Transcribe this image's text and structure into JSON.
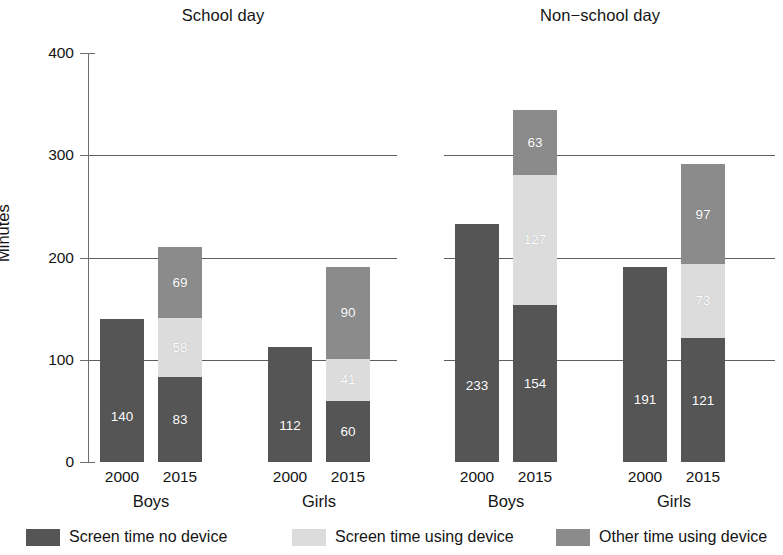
{
  "chart_data": {
    "type": "bar",
    "title": "",
    "subtitle": "",
    "stacked": true,
    "xlabel": "",
    "ylabel": "Minutes",
    "ylim": [
      0,
      400
    ],
    "yticks": [
      0,
      100,
      200,
      300,
      400
    ],
    "grid": "horizontal gridlines at 100, 200, 300",
    "legend_position": "bottom",
    "panels": [
      {
        "title": "School day",
        "groups": [
          {
            "label": "Boys",
            "bars": [
              {
                "x": "2000",
                "total": 140,
                "segments": [
                  {
                    "series": "Screen time no device",
                    "value": 140,
                    "label": "140",
                    "color": "#555555"
                  }
                ]
              },
              {
                "x": "2015",
                "total": 210,
                "segments": [
                  {
                    "series": "Screen time no device",
                    "value": 83,
                    "label": "83",
                    "color": "#555555"
                  },
                  {
                    "series": "Screen time using device",
                    "value": 58,
                    "label": "58",
                    "color": "#dcdcdc"
                  },
                  {
                    "series": "Other time using device",
                    "value": 69,
                    "label": "69",
                    "color": "#8b8b8b"
                  }
                ]
              }
            ]
          },
          {
            "label": "Girls",
            "bars": [
              {
                "x": "2000",
                "total": 112,
                "segments": [
                  {
                    "series": "Screen time no device",
                    "value": 112,
                    "label": "112",
                    "color": "#555555"
                  }
                ]
              },
              {
                "x": "2015",
                "total": 191,
                "segments": [
                  {
                    "series": "Screen time no device",
                    "value": 60,
                    "label": "60",
                    "color": "#555555"
                  },
                  {
                    "series": "Screen time using device",
                    "value": 41,
                    "label": "41",
                    "color": "#dcdcdc"
                  },
                  {
                    "series": "Other time using device",
                    "value": 90,
                    "label": "90",
                    "color": "#8b8b8b"
                  }
                ]
              }
            ]
          }
        ]
      },
      {
        "title": "Non−school day",
        "groups": [
          {
            "label": "Boys",
            "bars": [
              {
                "x": "2000",
                "total": 233,
                "segments": [
                  {
                    "series": "Screen time no device",
                    "value": 233,
                    "label": "233",
                    "color": "#555555"
                  }
                ]
              },
              {
                "x": "2015",
                "total": 344,
                "segments": [
                  {
                    "series": "Screen time no device",
                    "value": 154,
                    "label": "154",
                    "color": "#555555"
                  },
                  {
                    "series": "Screen time using device",
                    "value": 127,
                    "label": "127",
                    "color": "#dcdcdc"
                  },
                  {
                    "series": "Other time using device",
                    "value": 63,
                    "label": "63",
                    "color": "#8b8b8b"
                  }
                ]
              }
            ]
          },
          {
            "label": "Girls",
            "bars": [
              {
                "x": "2000",
                "total": 191,
                "segments": [
                  {
                    "series": "Screen time no device",
                    "value": 191,
                    "label": "191",
                    "color": "#555555"
                  }
                ]
              },
              {
                "x": "2015",
                "total": 291,
                "segments": [
                  {
                    "series": "Screen time no device",
                    "value": 121,
                    "label": "121",
                    "color": "#555555"
                  },
                  {
                    "series": "Screen time using device",
                    "value": 73,
                    "label": "73",
                    "color": "#dcdcdc"
                  },
                  {
                    "series": "Other time using device",
                    "value": 97,
                    "label": "97",
                    "color": "#8b8b8b"
                  }
                ]
              }
            ]
          }
        ]
      }
    ],
    "legend": [
      {
        "label": "Screen time no device",
        "color": "#555555",
        "swatch": "c-dark"
      },
      {
        "label": "Screen time using device",
        "color": "#dcdcdc",
        "swatch": "c-light"
      },
      {
        "label": "Other time using device",
        "color": "#8b8b8b",
        "swatch": "c-mid"
      }
    ]
  },
  "axis": {
    "y_label": "Minutes",
    "y_ticks": [
      "400",
      "300",
      "200",
      "100",
      "0"
    ]
  },
  "panel_titles": {
    "school": "School day",
    "nonschool": "Non−school day"
  },
  "legend_items": {
    "item0": "Screen time no device",
    "item1": "Screen time using device",
    "item2": "Other time using device"
  }
}
